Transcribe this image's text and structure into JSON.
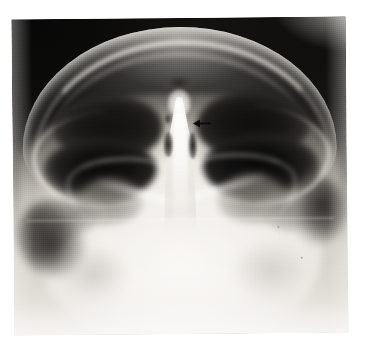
{
  "page": {
    "background_color": "#ffffff",
    "width": 370,
    "height": 350
  },
  "figure": {
    "type": "radiograph",
    "modality": "X-ray",
    "view": "submentovertex (base / axial) skull projection",
    "caption": "",
    "title": "",
    "film": {
      "left": 13,
      "top": 18,
      "width": 334,
      "height": 316,
      "rotation_deg": -0.55,
      "border_color": "#ececea",
      "tone_dark": "#0a0a09",
      "tone_mid": "#6e6b66",
      "tone_light": "#f6f4f1"
    },
    "regions": [
      {
        "name": "cranial-vault-outline",
        "tone": "bright",
        "position": "top arc"
      },
      {
        "name": "air-background-left",
        "tone": "black",
        "position": "top-left corner"
      },
      {
        "name": "air-background-right",
        "tone": "black",
        "position": "top-right corner"
      },
      {
        "name": "sinus-cavity-left-upper",
        "tone": "black",
        "position": "upper left"
      },
      {
        "name": "sinus-cavity-right-upper",
        "tone": "black",
        "position": "upper right"
      },
      {
        "name": "sinus-cavity-left-lower",
        "tone": "black",
        "position": "mid left"
      },
      {
        "name": "sinus-cavity-right-lower",
        "tone": "black",
        "position": "mid right"
      },
      {
        "name": "nasal-septum-midline",
        "tone": "bright",
        "position": "center"
      },
      {
        "name": "ethmoid-air-cells",
        "tone": "dark",
        "position": "center, flanking septum"
      },
      {
        "name": "maxillary-antrum-left",
        "tone": "mid-grey",
        "position": "lower left"
      },
      {
        "name": "maxillary-antrum-right",
        "tone": "mid-grey",
        "position": "lower right"
      },
      {
        "name": "zygomatic-arch-left",
        "tone": "bright line",
        "position": "left lateral"
      },
      {
        "name": "zygomatic-arch-right",
        "tone": "bright line",
        "position": "right lateral"
      },
      {
        "name": "skull-base-mandible",
        "tone": "bright",
        "position": "lower half"
      }
    ]
  },
  "annotations": [
    {
      "id": "arrow-1",
      "name": "annotation-arrow",
      "glyph": "left-arrow",
      "color": "#0d0d0d",
      "direction": "left",
      "x": 193,
      "y": 119,
      "width": 18,
      "height": 9,
      "points_at": "midline nasal septum / ethmoid region"
    }
  ],
  "labels": []
}
